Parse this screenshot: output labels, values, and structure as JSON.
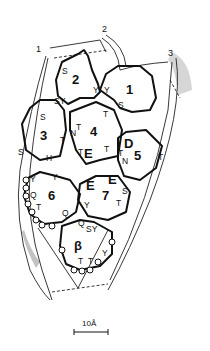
{
  "figure": {
    "reference_lines": [
      "1",
      "2",
      "3"
    ],
    "domains": [
      {
        "id": "1",
        "residues": [
          "Y",
          "S"
        ]
      },
      {
        "id": "2",
        "residues": [
          "S",
          "SY",
          "Y"
        ]
      },
      {
        "id": "3",
        "residues": [
          "S",
          "S",
          "T",
          "H"
        ]
      },
      {
        "id": "4",
        "residues": [
          "T",
          "N",
          "T",
          "T",
          "E",
          "T"
        ]
      },
      {
        "id": "5",
        "residues": [
          "D",
          "T",
          "N",
          "T"
        ]
      },
      {
        "id": "6",
        "residues": [
          "Y",
          "Y",
          "Q",
          "T",
          "Q"
        ]
      },
      {
        "id": "7",
        "residues": [
          "E",
          "E",
          "S",
          "T",
          "Y"
        ]
      },
      {
        "id": "β",
        "residues": [
          "Q",
          "SY",
          "T",
          "T",
          "Y"
        ]
      }
    ],
    "scale_bar": {
      "label": "10Å"
    }
  }
}
